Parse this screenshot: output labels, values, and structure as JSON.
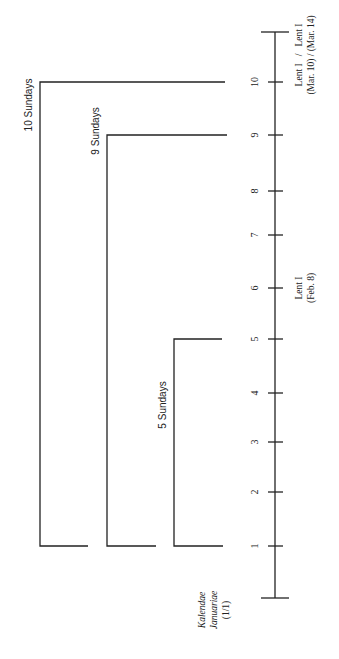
{
  "diagram": {
    "orientation": "rotated-90-ccw",
    "axis": {
      "start_label_line1": "Kalendae",
      "start_label_line2": "Januariae",
      "start_label_line3": "(1/1)",
      "ticks": [
        "1",
        "2",
        "3",
        "4",
        "5",
        "6",
        "7",
        "8",
        "9",
        "10"
      ]
    },
    "brackets": [
      {
        "label": "10 Sundays",
        "from": 1,
        "to": 10
      },
      {
        "label": "9 Sundays",
        "from": 1,
        "to": 9
      },
      {
        "label": "5 Sundays",
        "from": 1,
        "to": 5
      }
    ],
    "annotations": {
      "lent_feb_line1": "Lent I",
      "lent_feb_line2": "(Feb. 8)",
      "lent_mar_line1": "Lent I   /   Lent I",
      "lent_mar_line2": "(Mar. 10) / (Mar. 14)"
    }
  }
}
